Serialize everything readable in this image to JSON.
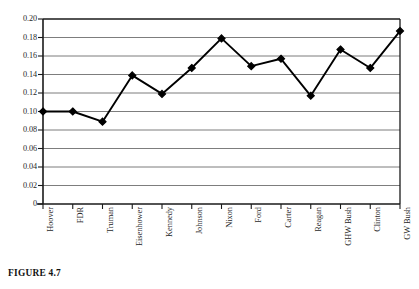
{
  "figure": {
    "caption": "FIGURE 4.7"
  },
  "chart_data": {
    "type": "line",
    "title": "",
    "xlabel": "",
    "ylabel": "",
    "ylim": [
      0,
      0.2
    ],
    "grid": true,
    "legend": false,
    "categories": [
      "Hoover",
      "FDR",
      "Truman",
      "Eisenhower",
      "Kennedy",
      "Johnson",
      "Nixon",
      "Ford",
      "Carter",
      "Reagan",
      "GHW Bush",
      "Clinton",
      "GW Bush"
    ],
    "values": [
      0.1,
      0.1,
      0.089,
      0.139,
      0.119,
      0.147,
      0.179,
      0.149,
      0.157,
      0.117,
      0.167,
      0.147,
      0.187
    ],
    "y_ticks": [
      0.2,
      0.18,
      0.16,
      0.14,
      0.12,
      0.1,
      0.08,
      0.06,
      0.04,
      0.02,
      0
    ],
    "y_tick_labels": [
      "0.20",
      "0.18",
      "0.16",
      "0.14",
      "0.12",
      "0.10",
      "0.08",
      "0.06",
      "0.04",
      "0.02",
      "0"
    ],
    "series": [
      {
        "name": "series-1",
        "marker": "diamond",
        "color": "#000000",
        "values": [
          0.1,
          0.1,
          0.089,
          0.139,
          0.119,
          0.147,
          0.179,
          0.149,
          0.157,
          0.117,
          0.167,
          0.147,
          0.187
        ]
      }
    ],
    "colors": {
      "line": "#000000",
      "marker": "#000000",
      "grid": "#6e6e6e",
      "frame": "#1a1a1a",
      "background": "#ffffff"
    }
  }
}
